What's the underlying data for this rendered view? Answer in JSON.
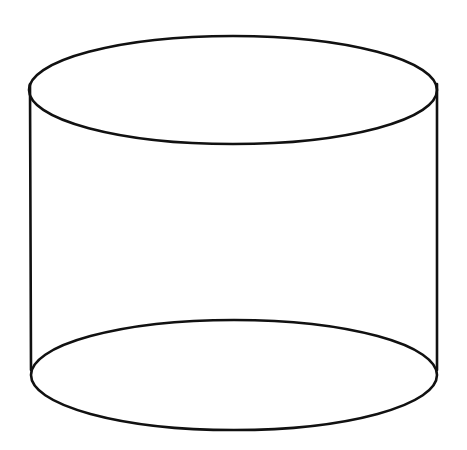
{
  "diagram": {
    "style": {
      "background": "#ffffff",
      "stroke_color": "#111111",
      "stroke_width": 2.6
    },
    "shapes": {
      "top_ellipse": {
        "cx": 233,
        "cy": 90,
        "rx": 204,
        "ry": 54
      },
      "bottom_ellipse": {
        "cx": 234,
        "cy": 375,
        "rx": 203,
        "ry": 55
      },
      "left_side": {
        "x1": 30,
        "y1": 84,
        "x2": 31,
        "y2": 370
      },
      "right_side": {
        "x1": 437,
        "y1": 84,
        "x2": 437,
        "y2": 370
      }
    }
  }
}
